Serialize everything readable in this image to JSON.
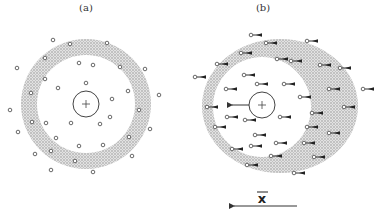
{
  "figure": {
    "panels": [
      {
        "id": "a",
        "label": "(a)",
        "label_pos": [
          86,
          11
        ],
        "center": [
          86,
          104
        ],
        "ion_radius": 13,
        "ion_symbol": "+",
        "shell": {
          "shape": "ring",
          "cx": 86,
          "cy": 104,
          "r_inner": 49,
          "r_outer": 65
        },
        "particles": [
          [
            53,
            40
          ],
          [
            70,
            44
          ],
          [
            107,
            43
          ],
          [
            45,
            58
          ],
          [
            17,
            68
          ],
          [
            79,
            63
          ],
          [
            93,
            65
          ],
          [
            120,
            67
          ],
          [
            145,
            69
          ],
          [
            45,
            79
          ],
          [
            86,
            83
          ],
          [
            58,
            88
          ],
          [
            128,
            91
          ],
          [
            31,
            93
          ],
          [
            159,
            95
          ],
          [
            112,
            99
          ],
          [
            10,
            110
          ],
          [
            139,
            110
          ],
          [
            110,
            117
          ],
          [
            32,
            122
          ],
          [
            46,
            123
          ],
          [
            71,
            123
          ],
          [
            100,
            124
          ],
          [
            150,
            129
          ],
          [
            18,
            132
          ],
          [
            56,
            138
          ],
          [
            129,
            137
          ],
          [
            79,
            146
          ],
          [
            103,
            145
          ],
          [
            51,
            151
          ],
          [
            35,
            154
          ],
          [
            132,
            156
          ],
          [
            75,
            161
          ],
          [
            51,
            170
          ],
          [
            93,
            172
          ]
        ]
      },
      {
        "id": "b",
        "label": "(b)",
        "label_pos": [
          263,
          11
        ],
        "center": [
          262,
          105
        ],
        "ion_radius": 13,
        "ion_symbol": "+",
        "ion_arrow": {
          "from": [
            249,
            105
          ],
          "to": [
            230,
            105
          ]
        },
        "shell": {
          "shape": "offset-ellipse",
          "outer": {
            "cx": 280,
            "cy": 106,
            "rx": 78,
            "ry": 67
          },
          "inner": {
            "cx": 262,
            "cy": 107,
            "rx": 49,
            "ry": 50
          }
        },
        "particles_with_arrows": [
          [
            251,
            35
          ],
          [
            266,
            43
          ],
          [
            307,
            41
          ],
          [
            241,
            53
          ],
          [
            217,
            64
          ],
          [
            277,
            59
          ],
          [
            291,
            61
          ],
          [
            320,
            65
          ],
          [
            340,
            68
          ],
          [
            195,
            77
          ],
          [
            244,
            75
          ],
          [
            257,
            84
          ],
          [
            284,
            84
          ],
          [
            226,
            89
          ],
          [
            329,
            89
          ],
          [
            363,
            89
          ],
          [
            300,
            97
          ],
          [
            207,
            107
          ],
          [
            344,
            107
          ],
          [
            312,
            113
          ],
          [
            227,
            117
          ],
          [
            245,
            120
          ],
          [
            280,
            117
          ],
          [
            215,
            127
          ],
          [
            307,
            127
          ],
          [
            329,
            133
          ],
          [
            255,
            135
          ],
          [
            276,
            143
          ],
          [
            251,
            146
          ],
          [
            304,
            143
          ],
          [
            232,
            149
          ],
          [
            271,
            156
          ],
          [
            314,
            157
          ],
          [
            247,
            165
          ],
          [
            294,
            173
          ]
        ]
      }
    ],
    "velocity_indicator": {
      "symbol": "x",
      "overline": true,
      "text_pos": [
        262,
        202
      ],
      "arrow": {
        "from": [
          297,
          206
        ],
        "to": [
          231,
          206
        ]
      }
    },
    "colors": {
      "ink": "#333333",
      "shell_fill": "#c8c8c8",
      "background": "#ffffff"
    }
  }
}
